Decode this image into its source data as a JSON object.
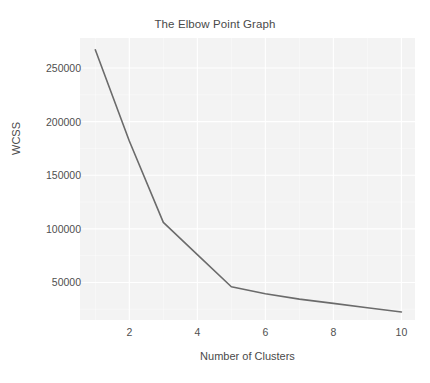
{
  "chart_data": {
    "type": "line",
    "title": "The Elbow Point Graph",
    "xlabel": "Number of Clusters",
    "ylabel": "WCSS",
    "x": [
      1,
      2,
      3,
      4,
      5,
      6,
      7,
      8,
      9,
      10
    ],
    "values": [
      267000,
      182000,
      106000,
      76000,
      46000,
      39500,
      34500,
      30500,
      26500,
      22500
    ],
    "xticks": [
      "2",
      "4",
      "6",
      "8",
      "10"
    ],
    "xtick_values": [
      2,
      4,
      6,
      8,
      10
    ],
    "yticks": [
      "50000",
      "100000",
      "150000",
      "200000",
      "250000"
    ],
    "ytick_values": [
      50000,
      100000,
      150000,
      200000,
      250000
    ],
    "xlim": [
      0.55,
      10.4
    ],
    "ylim": [
      15000,
      278000
    ],
    "grid": true,
    "legend": null,
    "line_color": "#6b6b6b",
    "plot_bg_color": "#f3f3f3",
    "grid_color": "#ffffff",
    "text_color": "#4a4a4a"
  }
}
